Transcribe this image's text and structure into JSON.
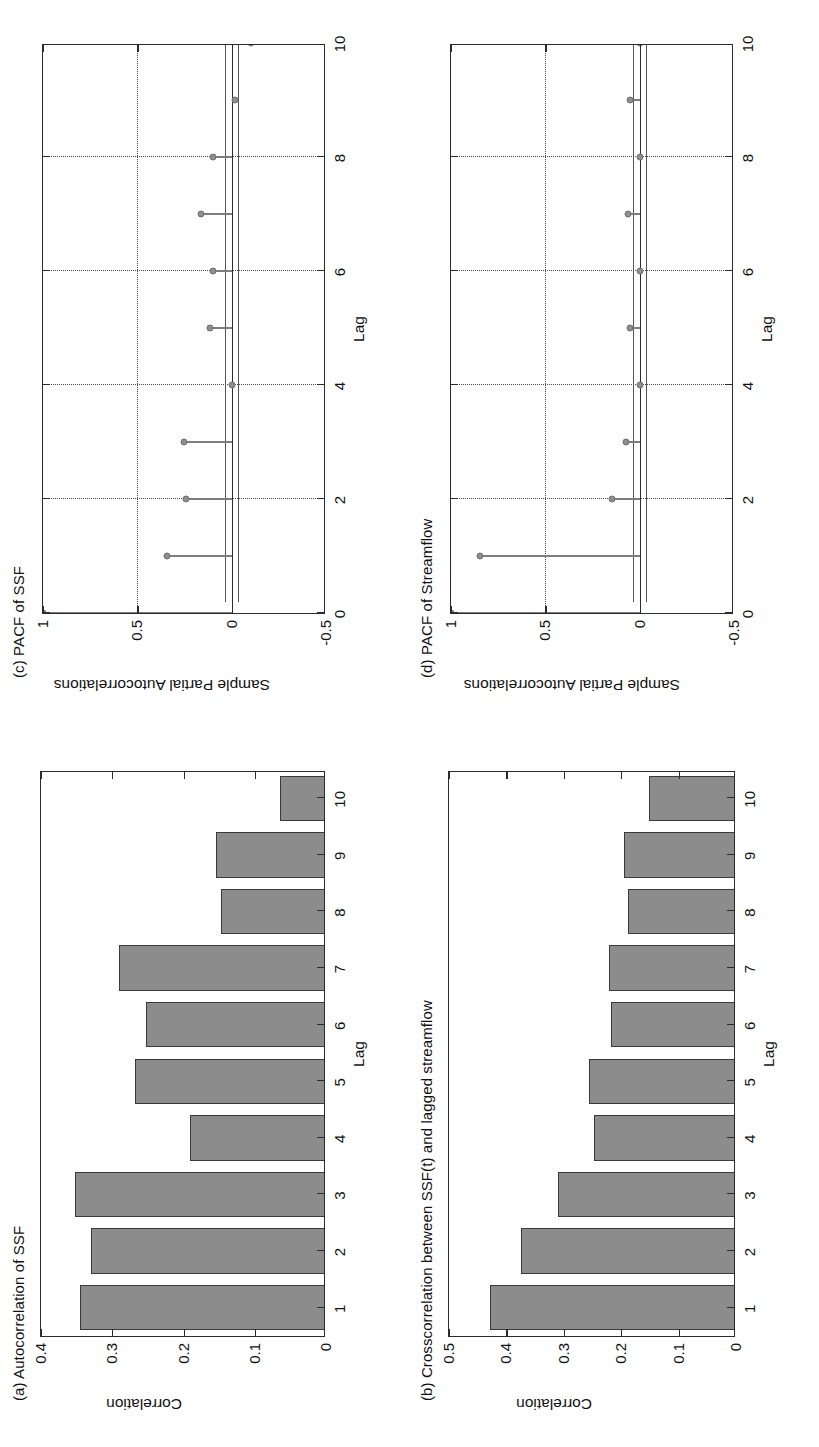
{
  "figure": {
    "orientation": "rotated-90-ccw",
    "background": "#ffffff",
    "bar_fill": "#8c8c8c",
    "bar_edge": "#3a3a3a",
    "marker_color": "#8e8e8e",
    "axis_color": "#2b2b2b"
  },
  "panels": {
    "a": {
      "title": "(a) Autocorrelation of SSF",
      "xlabel": "Lag",
      "ylabel": "Correlation",
      "xticklabels": [
        "1",
        "2",
        "3",
        "4",
        "5",
        "6",
        "7",
        "8",
        "9",
        "10"
      ],
      "yticklabels": [
        "0",
        "0.1",
        "0.2",
        "0.3",
        "0.4"
      ]
    },
    "b": {
      "title": "(b) Crosscorrelation between  SSF(t) and lagged streamflow",
      "xlabel": "Lag",
      "ylabel": "Correlation",
      "xticklabels": [
        "1",
        "2",
        "3",
        "4",
        "5",
        "6",
        "7",
        "8",
        "9",
        "10"
      ],
      "yticklabels": [
        "0",
        "0.1",
        "0.2",
        "0.3",
        "0.4",
        "0.5"
      ]
    },
    "c": {
      "title": "(c) PACF of SSF",
      "xlabel": "Lag",
      "ylabel": "Sample Partial Autocorrelations",
      "xticklabels": [
        "0",
        "2",
        "4",
        "6",
        "8",
        "10"
      ],
      "yticklabels": [
        "-0.5",
        "0",
        "0.5",
        "1"
      ]
    },
    "d": {
      "title": "(d) PACF of Streamflow",
      "xlabel": "Lag",
      "ylabel": "Sample Partial Autocorrelations",
      "xticklabels": [
        "0",
        "2",
        "4",
        "6",
        "8",
        "10"
      ],
      "yticklabels": [
        "-0.5",
        "0",
        "0.5",
        "1"
      ]
    }
  },
  "chart_data": [
    {
      "id": "a",
      "type": "bar",
      "title": "(a) Autocorrelation of SSF",
      "xlabel": "Lag",
      "ylabel": "Correlation",
      "categories": [
        1,
        2,
        3,
        4,
        5,
        6,
        7,
        8,
        9,
        10
      ],
      "values": [
        0.345,
        0.33,
        0.352,
        0.191,
        0.268,
        0.253,
        0.291,
        0.148,
        0.155,
        0.065
      ],
      "xlim": [
        0.5,
        10.5
      ],
      "ylim": [
        0,
        0.4
      ],
      "yticks": [
        0,
        0.1,
        0.2,
        0.3,
        0.4
      ],
      "grid": false,
      "legend": null
    },
    {
      "id": "b",
      "type": "bar",
      "title": "(b) Crosscorrelation between  SSF(t) and lagged streamflow",
      "xlabel": "Lag",
      "ylabel": "Correlation",
      "categories": [
        1,
        2,
        3,
        4,
        5,
        6,
        7,
        8,
        9,
        10
      ],
      "values": [
        0.428,
        0.375,
        0.31,
        0.248,
        0.256,
        0.218,
        0.222,
        0.188,
        0.196,
        0.152
      ],
      "xlim": [
        0.5,
        10.5
      ],
      "ylim": [
        0,
        0.5
      ],
      "yticks": [
        0,
        0.1,
        0.2,
        0.3,
        0.4,
        0.5
      ],
      "grid": false,
      "legend": null
    },
    {
      "id": "c",
      "type": "scatter",
      "subtype": "stem",
      "title": "(c) PACF of SSF",
      "xlabel": "Lag",
      "ylabel": "Sample Partial Autocorrelations",
      "x": [
        0,
        1,
        2,
        3,
        4,
        5,
        6,
        7,
        8,
        9,
        10
      ],
      "values": [
        1.0,
        0.345,
        0.24,
        0.255,
        0.0,
        0.115,
        0.1,
        0.16,
        0.1,
        -0.02,
        -0.1
      ],
      "confidence_bounds": [
        0.035,
        -0.035
      ],
      "xlim": [
        0,
        10
      ],
      "ylim": [
        -0.5,
        1
      ],
      "xticks": [
        0,
        2,
        4,
        6,
        8,
        10
      ],
      "yticks": [
        -0.5,
        0,
        0.5,
        1
      ],
      "grid": true
    },
    {
      "id": "d",
      "type": "scatter",
      "subtype": "stem",
      "title": "(d) PACF of Streamflow",
      "xlabel": "Lag",
      "ylabel": "Sample Partial Autocorrelations",
      "x": [
        0,
        1,
        2,
        3,
        4,
        5,
        6,
        7,
        8,
        9,
        10
      ],
      "values": [
        1.0,
        0.845,
        0.145,
        0.075,
        0.0,
        0.05,
        0.0,
        0.06,
        0.0,
        0.05,
        0.0
      ],
      "confidence_bounds": [
        0.035,
        -0.035
      ],
      "xlim": [
        0,
        10
      ],
      "ylim": [
        -0.5,
        1
      ],
      "xticks": [
        0,
        2,
        4,
        6,
        8,
        10
      ],
      "yticks": [
        -0.5,
        0,
        0.5,
        1
      ],
      "grid": true
    }
  ]
}
